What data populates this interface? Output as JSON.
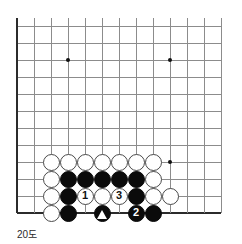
{
  "figure": {
    "caption": "20도",
    "kind": "go-board-diagram",
    "colors": {
      "grid_line": "#8c8c8c",
      "board_edge": "#2b2b2b",
      "black_stone": "#0b0b0b",
      "white_stone": "#ffffff",
      "white_stone_border": "#4a4a4a",
      "background": "#ffffff"
    }
  },
  "board": {
    "origin_x": 17,
    "origin_y": 26,
    "cell": 17,
    "cols": 13,
    "rows": 12,
    "edges": {
      "left": true,
      "top": false,
      "right": false,
      "bottom": true
    },
    "star_points": [
      {
        "col": 3,
        "row": 2
      },
      {
        "col": 9,
        "row": 2
      },
      {
        "col": 9,
        "row": 8
      }
    ],
    "stones": [
      {
        "col": 2,
        "row": 8,
        "color": "white",
        "label": ""
      },
      {
        "col": 3,
        "row": 8,
        "color": "white",
        "label": ""
      },
      {
        "col": 4,
        "row": 8,
        "color": "white",
        "label": ""
      },
      {
        "col": 5,
        "row": 8,
        "color": "white",
        "label": ""
      },
      {
        "col": 6,
        "row": 8,
        "color": "white",
        "label": ""
      },
      {
        "col": 7,
        "row": 8,
        "color": "white",
        "label": ""
      },
      {
        "col": 8,
        "row": 8,
        "color": "white",
        "label": ""
      },
      {
        "col": 2,
        "row": 9,
        "color": "white",
        "label": ""
      },
      {
        "col": 3,
        "row": 9,
        "color": "black",
        "label": ""
      },
      {
        "col": 4,
        "row": 9,
        "color": "black",
        "label": ""
      },
      {
        "col": 5,
        "row": 9,
        "color": "black",
        "label": ""
      },
      {
        "col": 6,
        "row": 9,
        "color": "black",
        "label": ""
      },
      {
        "col": 7,
        "row": 9,
        "color": "black",
        "label": ""
      },
      {
        "col": 8,
        "row": 9,
        "color": "white",
        "label": ""
      },
      {
        "col": 2,
        "row": 10,
        "color": "white",
        "label": ""
      },
      {
        "col": 3,
        "row": 10,
        "color": "black",
        "label": ""
      },
      {
        "col": 4,
        "row": 10,
        "color": "white",
        "label": "1"
      },
      {
        "col": 5,
        "row": 10,
        "color": "white",
        "label": ""
      },
      {
        "col": 6,
        "row": 10,
        "color": "white",
        "label": "3"
      },
      {
        "col": 7,
        "row": 10,
        "color": "black",
        "label": ""
      },
      {
        "col": 8,
        "row": 10,
        "color": "white",
        "label": ""
      },
      {
        "col": 9,
        "row": 10,
        "color": "white",
        "label": ""
      },
      {
        "col": 2,
        "row": 11,
        "color": "white",
        "label": ""
      },
      {
        "col": 3,
        "row": 11,
        "color": "black",
        "label": ""
      },
      {
        "col": 5,
        "row": 11,
        "color": "black",
        "label": "",
        "mark": "triangle"
      },
      {
        "col": 7,
        "row": 11,
        "color": "black",
        "label": "2"
      },
      {
        "col": 8,
        "row": 11,
        "color": "black",
        "label": ""
      }
    ]
  }
}
